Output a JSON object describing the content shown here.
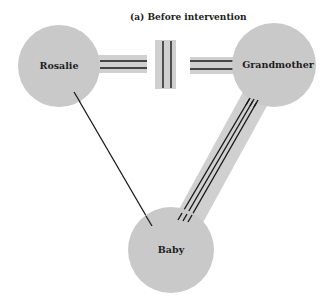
{
  "title": "(a)  Before intervention",
  "colors": {
    "node_fill": "#c9c9c9",
    "band_fill": "#d0d0d0",
    "line": "#1a1a1a",
    "background": "#ffffff"
  },
  "nodes": [
    {
      "id": "rosalie",
      "label": "Rosalie",
      "cx": 59,
      "cy": 66,
      "r": 41
    },
    {
      "id": "grandmother",
      "label": "Grandmother",
      "cx": 274,
      "cy": 65,
      "r": 42
    },
    {
      "id": "baby",
      "label": "Baby",
      "cx": 171,
      "cy": 250,
      "r": 43
    }
  ],
  "edges": [
    {
      "from": "Rosalie",
      "to": "Grandmother",
      "type": "conflicted",
      "description": "double lines broken by a barrier (double vertical bar)"
    },
    {
      "from": "Grandmother",
      "to": "Baby",
      "type": "very close",
      "description": "triple lines"
    },
    {
      "from": "Rosalie",
      "to": "Baby",
      "type": "weak",
      "description": "single thin line"
    }
  ]
}
